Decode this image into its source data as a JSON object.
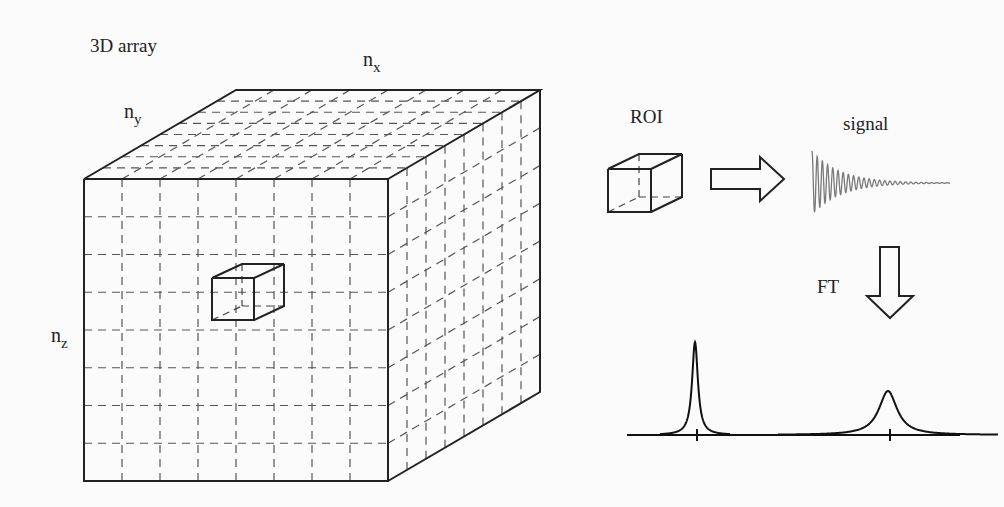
{
  "title": "3D array",
  "labels": {
    "nx": "n",
    "nx_sub": "x",
    "ny": "n",
    "ny_sub": "y",
    "nz": "n",
    "nz_sub": "z",
    "roi": "ROI",
    "signal": "signal",
    "ft": "FT"
  },
  "array": {
    "front_face": {
      "x0": 84,
      "y0": 179,
      "x1": 388,
      "y1": 481
    },
    "depth_offset": {
      "dx": 152,
      "dy": -89
    },
    "grid_divisions": {
      "x": 8,
      "y": 8,
      "depth": 8
    }
  },
  "roi_voxel_in_array": {
    "x": 212,
    "y": 278,
    "size": 42,
    "dx": 30,
    "dy": -14
  },
  "roi_cube": {
    "x": 608,
    "y": 169,
    "size": 43,
    "dx": 31,
    "dy": -15
  },
  "signal_trace": {
    "x_start": 812,
    "x_end": 950,
    "baseline_y": 183,
    "amplitude": 32,
    "color": "#7a7a7a"
  },
  "spectrum": {
    "baseline_y": 435,
    "x_start": 627,
    "x_end": 960,
    "peaks": [
      {
        "x": 695,
        "height": 93,
        "width": 3.5
      },
      {
        "x": 888,
        "height": 44,
        "width": 11
      }
    ]
  }
}
